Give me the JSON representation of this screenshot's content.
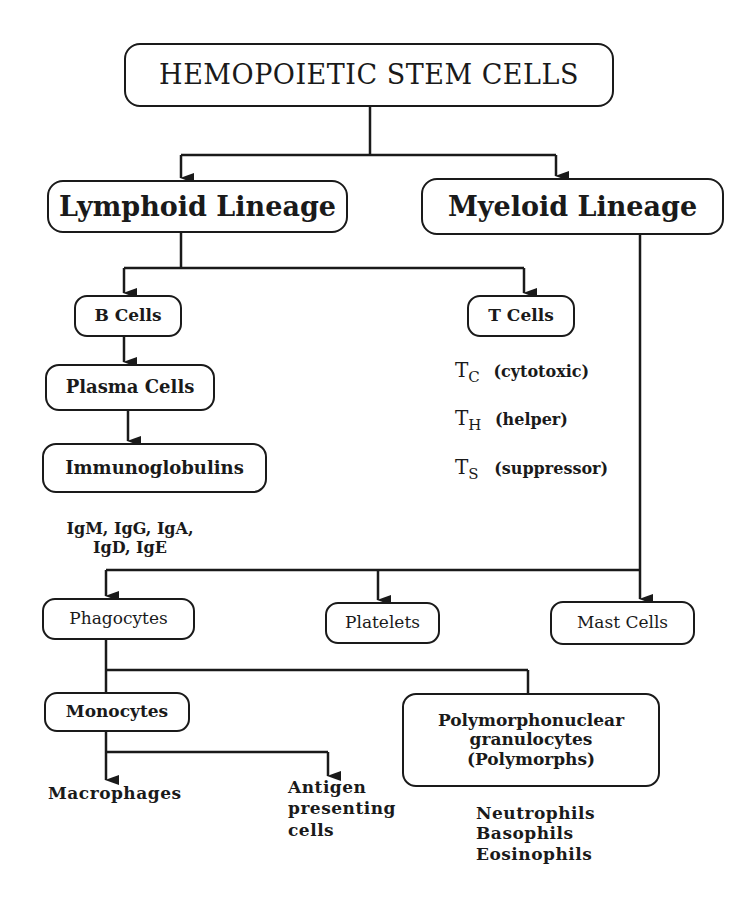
{
  "diagram": {
    "root": {
      "label": "HEMOPOIETIC STEM CELLS"
    },
    "lymphoid": {
      "label": "Lymphoid Lineage"
    },
    "myeloid": {
      "label": "Myeloid Lineage"
    },
    "b_cells": {
      "label": "B Cells"
    },
    "t_cells": {
      "label": "T Cells"
    },
    "plasma_cells": {
      "label": "Plasma Cells"
    },
    "immunoglobulins": {
      "label": "Immunoglobulins"
    },
    "ig_types": {
      "line1": "IgM, IgG, IgA,",
      "line2": "IgD, IgE"
    },
    "t_subtypes": [
      {
        "symbol": "T",
        "subscript": "C",
        "description": "(cytotoxic)"
      },
      {
        "symbol": "T",
        "subscript": "H",
        "description": "(helper)"
      },
      {
        "symbol": "T",
        "subscript": "S",
        "description": "(suppressor)"
      }
    ],
    "phagocytes": {
      "label": "Phagocytes"
    },
    "platelets": {
      "label": "Platelets"
    },
    "mast_cells": {
      "label": "Mast Cells"
    },
    "monocytes": {
      "label": "Monocytes"
    },
    "polymorphs": {
      "line1": "Polymorphonuclear",
      "line2": "granulocytes",
      "line3": "(Polymorphs)"
    },
    "macrophages": {
      "label": "Macrophages"
    },
    "antigen_presenting": {
      "line1": "Antigen",
      "line2": "presenting",
      "line3": "cells"
    },
    "granulocyte_types": [
      "Neutrophils",
      "Basophils",
      "Eosinophils"
    ]
  },
  "colors": {
    "stroke": "#1a1a1a",
    "background": "#ffffff"
  }
}
